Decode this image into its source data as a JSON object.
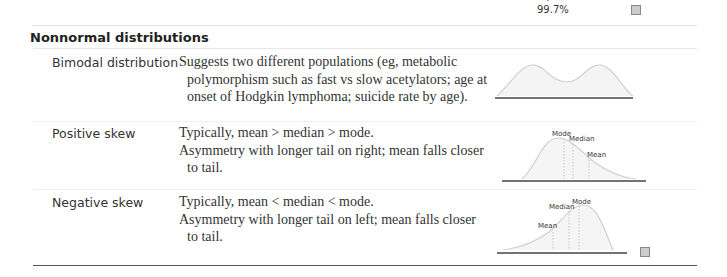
{
  "top": {
    "percent": "99.7%",
    "caret": "∨",
    "icon": "image-icon"
  },
  "section": {
    "title": "Nonnormal distributions"
  },
  "rows": [
    {
      "label": "Bimodal distribution",
      "description": [
        "Suggests two different populations (eg, metabolic polymorphism such as fast vs slow acetylators; age at onset of Hodgkin lymphoma; suicide rate by age)."
      ],
      "figure": "bimodal-curve"
    },
    {
      "label": "Positive skew",
      "description": [
        "Typically, mean > median > mode.",
        "Asymmetry with longer tail on right; mean falls closer to tail."
      ],
      "figure": "positive-skew-curve",
      "markers": [
        "Mode",
        "Median",
        "Mean"
      ]
    },
    {
      "label": "Negative skew",
      "description": [
        "Typically, mean < median < mode.",
        "Asymmetry with longer tail on left; mean falls closer to tail."
      ],
      "figure": "negative-skew-curve",
      "markers": [
        "Mean",
        "Median",
        "Mode"
      ],
      "icon": "image-icon"
    }
  ]
}
